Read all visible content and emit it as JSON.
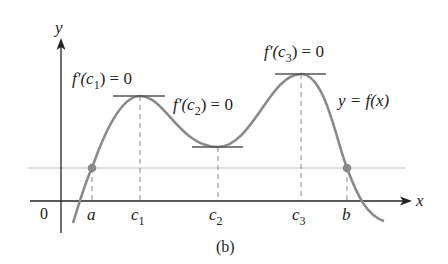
{
  "figure": {
    "caption": "(b)",
    "curve_label": "y = f(x)",
    "axes": {
      "x_label": "x",
      "y_label": "y",
      "origin_label": "0"
    },
    "x_ticks": [
      {
        "label": "a",
        "sub": ""
      },
      {
        "label": "c",
        "sub": "1"
      },
      {
        "label": "c",
        "sub": "2"
      },
      {
        "label": "c",
        "sub": "3"
      },
      {
        "label": "b",
        "sub": ""
      }
    ],
    "annotations": [
      {
        "point": "c1",
        "text_pre": "f′(c",
        "sub": "1",
        "text_post": ") = 0"
      },
      {
        "point": "c2",
        "text_pre": "f′(c",
        "sub": "2",
        "text_post": ") = 0"
      },
      {
        "point": "c3",
        "text_pre": "f′(c",
        "sub": "3",
        "text_post": ") = 0"
      }
    ],
    "colors": {
      "curve": "#8a8a8a",
      "axis": "#222222",
      "reference_line": "#d0d0d0",
      "dashed": "#8a8a8a",
      "tangent": "#555555",
      "point": "#8a8a8a"
    }
  }
}
